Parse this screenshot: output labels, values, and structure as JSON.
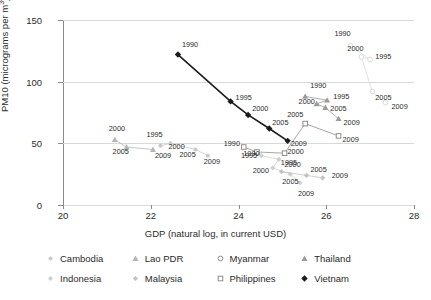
{
  "chart_data": {
    "type": "scatter",
    "title": "",
    "xlabel": "GDP (natural log, in current USD)",
    "ylabel": "PM10 (micrograms per m³)",
    "xlim": [
      20,
      28
    ],
    "ylim": [
      0,
      150
    ],
    "xticks": [
      20,
      22,
      24,
      26,
      28
    ],
    "yticks": [
      0,
      50,
      100,
      150
    ],
    "grid": "horizontal",
    "legend_position": "below",
    "point_labels": [
      "1990",
      "1995",
      "2000",
      "2005",
      "2009"
    ],
    "series": [
      {
        "name": "Cambodia",
        "color": "#c9c9c9",
        "marker": "circle-small",
        "points": [
          {
            "label": "1995",
            "x": 22.22,
            "y": 48
          },
          {
            "label": "2000",
            "x": 22.45,
            "y": 50
          },
          {
            "label": "2005",
            "x": 23.02,
            "y": 45
          },
          {
            "label": "2009",
            "x": 23.3,
            "y": 40
          }
        ]
      },
      {
        "name": "Lao PDR",
        "color": "#b5b5b5",
        "marker": "triangle",
        "points": [
          {
            "label": "2000",
            "x": 21.18,
            "y": 53
          },
          {
            "label": "2005",
            "x": 21.45,
            "y": 47
          },
          {
            "label": "2009",
            "x": 22.05,
            "y": 45
          }
        ]
      },
      {
        "name": "Myanmar",
        "color": "#dadada",
        "marker": "circle-open",
        "points": [
          {
            "label": "1990",
            "x": 26.55,
            "y": 129
          },
          {
            "label": "1995",
            "x": 27.0,
            "y": 118
          },
          {
            "label": "2000",
            "x": 26.8,
            "y": 120
          },
          {
            "label": "2005",
            "x": 27.05,
            "y": 92
          },
          {
            "label": "2009",
            "x": 27.35,
            "y": 83
          }
        ]
      },
      {
        "name": "Thailand",
        "color": "#9a9a9a",
        "marker": "triangle",
        "points": [
          {
            "label": "1990",
            "x": 25.52,
            "y": 88
          },
          {
            "label": "1995",
            "x": 26.02,
            "y": 85
          },
          {
            "label": "2000",
            "x": 25.78,
            "y": 82
          },
          {
            "label": "2005",
            "x": 25.98,
            "y": 79
          },
          {
            "label": "2009",
            "x": 26.28,
            "y": 70
          }
        ]
      },
      {
        "name": "Indonesia",
        "color": "#cfcfcf",
        "marker": "diamond-small",
        "points": [
          {
            "label": "1990",
            "x": 24.52,
            "y": 40
          },
          {
            "label": "1995",
            "x": 24.92,
            "y": 37
          },
          {
            "label": "2000",
            "x": 24.78,
            "y": 30
          },
          {
            "label": "2005",
            "x": 25.18,
            "y": 25
          },
          {
            "label": "2009",
            "x": 25.4,
            "y": 18
          }
        ]
      },
      {
        "name": "Malaysia",
        "color": "#c2c2c2",
        "marker": "diamond-small",
        "points": [
          {
            "label": "2000",
            "x": 24.98,
            "y": 27
          },
          {
            "label": "2005",
            "x": 25.55,
            "y": 24
          },
          {
            "label": "2009",
            "x": 25.92,
            "y": 22
          }
        ]
      },
      {
        "name": "Philippines",
        "color": "#8f8f8f",
        "marker": "square-open",
        "points": [
          {
            "label": "1990",
            "x": 24.12,
            "y": 47
          },
          {
            "label": "1995",
            "x": 24.42,
            "y": 43
          },
          {
            "label": "2000",
            "x": 25.05,
            "y": 42
          },
          {
            "label": "2005",
            "x": 25.52,
            "y": 66
          },
          {
            "label": "2009",
            "x": 26.28,
            "y": 56
          }
        ]
      },
      {
        "name": "Vietnam",
        "color": "#1c1c1c",
        "marker": "diamond",
        "points": [
          {
            "label": "1990",
            "x": 22.62,
            "y": 122
          },
          {
            "label": "1995",
            "x": 23.82,
            "y": 84
          },
          {
            "label": "2000",
            "x": 24.22,
            "y": 73
          },
          {
            "label": "2005",
            "x": 24.7,
            "y": 62
          },
          {
            "label": "2009",
            "x": 25.12,
            "y": 52
          }
        ]
      }
    ]
  },
  "legend": {
    "items": [
      {
        "label": "Cambodia",
        "marker": "circle-small",
        "color": "#c9c9c9"
      },
      {
        "label": "Lao PDR",
        "marker": "triangle",
        "color": "#b5b5b5"
      },
      {
        "label": "Myanmar",
        "marker": "circle-open",
        "color": "#8f8f8f"
      },
      {
        "label": "Thailand",
        "marker": "triangle",
        "color": "#9a9a9a"
      },
      {
        "label": "Indonesia",
        "marker": "diamond-small",
        "color": "#cfcfcf"
      },
      {
        "label": "Malaysia",
        "marker": "diamond-small",
        "color": "#c2c2c2"
      },
      {
        "label": "Philippines",
        "marker": "square-open",
        "color": "#8f8f8f"
      },
      {
        "label": "Vietnam",
        "marker": "diamond",
        "color": "#1c1c1c"
      }
    ]
  }
}
